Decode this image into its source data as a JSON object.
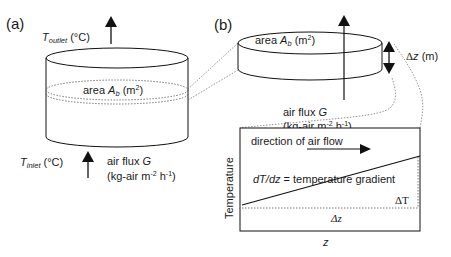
{
  "panels": {
    "a": {
      "label": "(a)",
      "outlet_T": "T",
      "outlet_sub": "outlet",
      "outlet_unit": " (°C)",
      "inlet_T": "T",
      "inlet_sub": "inlet",
      "inlet_unit": " (°C)",
      "area_prefix": "area ",
      "area_A": "A",
      "area_sub": "b",
      "area_unit_open": " (m",
      "area_sup": "2",
      "area_unit_close": ")",
      "flux_line1_prefix": "air flux ",
      "flux_line1_G": "G",
      "flux_line2_a": "(kg-air m",
      "flux_sup1": "-2",
      "flux_line2_b": " h",
      "flux_sup2": "-1",
      "flux_line2_c": ")"
    },
    "b": {
      "label": "(b)",
      "area_prefix": "area ",
      "area_A": "A",
      "area_sub": "b",
      "area_unit_open": " (m",
      "area_sup": "2",
      "area_unit_close": ")",
      "dz_delta": "Δ",
      "dz_z": "z",
      "dz_unit": " (m)",
      "flux_line1_prefix": "air flux ",
      "flux_line1_G": "G",
      "flux_line2_a": "(kg-air m",
      "flux_sup1": "-2",
      "flux_line2_b": " h",
      "flux_sup2": "-1",
      "flux_line2_c": ")"
    },
    "graph": {
      "y_axis_label": "Temperature",
      "x_axis_label": "z",
      "flow_label": "direction of air flow",
      "gradient_lhs": "dT/dz",
      "gradient_rhs": " = temperature gradient",
      "delta_T": "ΔT",
      "delta_z": "Δz"
    }
  }
}
